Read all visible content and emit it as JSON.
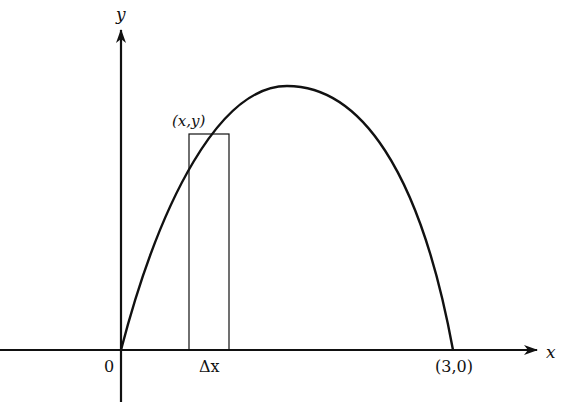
{
  "diagram": {
    "type": "area-under-curve-riemann-strip",
    "axes": {
      "x_label": "x",
      "y_label": "y",
      "origin_label": "0"
    },
    "curve": {
      "description": "parabola-like arch from origin to (3,0)",
      "start_point": "0",
      "end_point_label": "(3,0)"
    },
    "strip": {
      "point_label": "(x,y)",
      "width_label": "Δx"
    },
    "colors": {
      "stroke": "#111111",
      "background": "#ffffff"
    }
  }
}
